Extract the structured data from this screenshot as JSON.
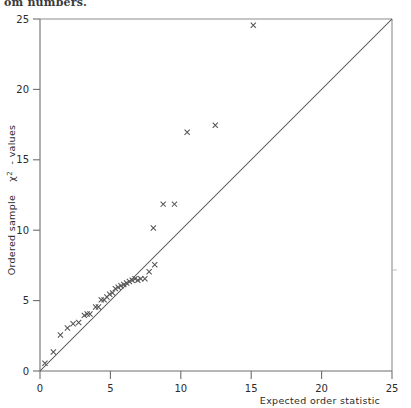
{
  "caption": {
    "fragment_text": "om numbers."
  },
  "chart_data": {
    "type": "scatter",
    "title": "",
    "subtitle": "",
    "xlabel": "Expected order statistic",
    "ylabel": "Ordered sample  χ² - values",
    "ylabel_parts": {
      "prefix": "Ordered sample",
      "symbol": "χ",
      "superscript": "2",
      "suffix": "- values"
    },
    "xlim": [
      0,
      25
    ],
    "ylim": [
      0,
      25
    ],
    "xticks": [
      0,
      5,
      10,
      15,
      20,
      25
    ],
    "yticks": [
      0,
      5,
      10,
      15,
      20,
      25
    ],
    "xtick_labels": [
      "0",
      "5",
      "10",
      "15",
      "20",
      "25"
    ],
    "ytick_labels": [
      "0",
      "5",
      "10",
      "15",
      "20",
      "25"
    ],
    "grid": false,
    "legend": null,
    "marker_style": "x",
    "marker_color": "#555555",
    "line_color": "#4a4a4a",
    "axis_color": "#6e6e6e",
    "reference_line": {
      "label": "y = x",
      "from": [
        0,
        0
      ],
      "to": [
        25,
        25
      ]
    },
    "points": [
      [
        0.35,
        0.55
      ],
      [
        0.95,
        1.35
      ],
      [
        1.45,
        2.55
      ],
      [
        1.95,
        3.05
      ],
      [
        2.35,
        3.35
      ],
      [
        2.75,
        3.45
      ],
      [
        3.15,
        3.95
      ],
      [
        3.35,
        4.05
      ],
      [
        3.55,
        4.05
      ],
      [
        3.95,
        4.55
      ],
      [
        4.15,
        4.55
      ],
      [
        4.35,
        5.05
      ],
      [
        4.55,
        5.05
      ],
      [
        4.75,
        5.25
      ],
      [
        4.95,
        5.45
      ],
      [
        5.15,
        5.55
      ],
      [
        5.35,
        5.85
      ],
      [
        5.55,
        5.95
      ],
      [
        5.75,
        6.05
      ],
      [
        5.95,
        6.15
      ],
      [
        6.15,
        6.25
      ],
      [
        6.35,
        6.35
      ],
      [
        6.55,
        6.45
      ],
      [
        6.75,
        6.55
      ],
      [
        6.95,
        6.45
      ],
      [
        7.15,
        6.55
      ],
      [
        7.45,
        6.55
      ],
      [
        7.75,
        7.05
      ],
      [
        8.15,
        7.55
      ],
      [
        8.05,
        10.15
      ],
      [
        8.75,
        11.85
      ],
      [
        9.55,
        11.85
      ],
      [
        10.45,
        16.95
      ],
      [
        12.45,
        17.45
      ],
      [
        15.15,
        24.55
      ]
    ],
    "n_points": 35,
    "edge_marker": {
      "axis": "right",
      "value": 7.0
    }
  }
}
